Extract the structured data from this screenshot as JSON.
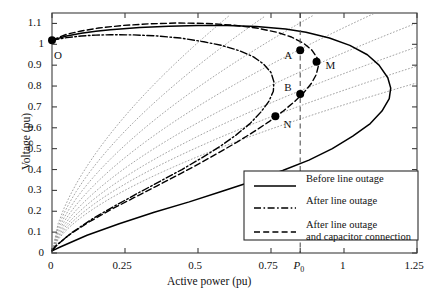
{
  "chart_data": {
    "type": "line",
    "title": "",
    "xlabel": "Active power (pu)",
    "ylabel": "Voltage (pu)",
    "xlim": [
      0,
      1.25
    ],
    "ylim": [
      0,
      1.15
    ],
    "grid": false,
    "xticks": [
      {
        "value": 0,
        "label": "0"
      },
      {
        "value": 0.25,
        "label": "0.25"
      },
      {
        "value": 0.5,
        "label": "0.5"
      },
      {
        "value": 0.75,
        "label": "0.75"
      },
      {
        "value": 0.85,
        "label": "P0"
      },
      {
        "value": 1,
        "label": "1"
      },
      {
        "value": 1.25,
        "label": "1.25"
      }
    ],
    "yticks": [
      {
        "value": 0,
        "label": "0"
      },
      {
        "value": 0.1,
        "label": "0.1"
      },
      {
        "value": 0.2,
        "label": "0.2"
      },
      {
        "value": 0.3,
        "label": "0.3"
      },
      {
        "value": 0.4,
        "label": "0.4"
      },
      {
        "value": 0.5,
        "label": "0.5"
      },
      {
        "value": 0.6,
        "label": "0.6"
      },
      {
        "value": 0.7,
        "label": "0.7"
      },
      {
        "value": 0.8,
        "label": "0.8"
      },
      {
        "value": 0.9,
        "label": "0.9"
      },
      {
        "value": 1.0,
        "label": "1"
      },
      {
        "value": 1.1,
        "label": "1.1"
      }
    ],
    "series": [
      {
        "name": "Before line outage",
        "style": "solid",
        "points": [
          [
            0.0,
            1.02
          ],
          [
            0.05,
            1.04
          ],
          [
            0.1,
            1.053
          ],
          [
            0.15,
            1.062
          ],
          [
            0.2,
            1.07
          ],
          [
            0.3,
            1.08
          ],
          [
            0.4,
            1.087
          ],
          [
            0.5,
            1.09
          ],
          [
            0.6,
            1.09
          ],
          [
            0.7,
            1.085
          ],
          [
            0.8,
            1.073
          ],
          [
            0.87,
            1.058
          ],
          [
            0.95,
            1.03
          ],
          [
            1.02,
            0.995
          ],
          [
            1.08,
            0.95
          ],
          [
            1.12,
            0.9
          ],
          [
            1.15,
            0.84
          ],
          [
            1.16,
            0.79
          ],
          [
            1.155,
            0.74
          ],
          [
            1.13,
            0.68
          ],
          [
            1.09,
            0.62
          ],
          [
            1.03,
            0.56
          ],
          [
            0.96,
            0.5
          ],
          [
            0.88,
            0.445
          ],
          [
            0.79,
            0.395
          ],
          [
            0.69,
            0.345
          ],
          [
            0.58,
            0.295
          ],
          [
            0.47,
            0.245
          ],
          [
            0.35,
            0.195
          ],
          [
            0.23,
            0.14
          ],
          [
            0.12,
            0.085
          ],
          [
            0.03,
            0.03
          ],
          [
            0.0,
            0.01
          ]
        ]
      },
      {
        "name": "After line outage",
        "style": "dashdot",
        "points": [
          [
            0.0,
            1.02
          ],
          [
            0.05,
            1.032
          ],
          [
            0.1,
            1.04
          ],
          [
            0.15,
            1.044
          ],
          [
            0.2,
            1.046
          ],
          [
            0.28,
            1.045
          ],
          [
            0.36,
            1.04
          ],
          [
            0.44,
            1.03
          ],
          [
            0.52,
            1.012
          ],
          [
            0.58,
            0.995
          ],
          [
            0.64,
            0.97
          ],
          [
            0.69,
            0.94
          ],
          [
            0.725,
            0.905
          ],
          [
            0.75,
            0.865
          ],
          [
            0.76,
            0.82
          ],
          [
            0.758,
            0.775
          ],
          [
            0.742,
            0.725
          ],
          [
            0.715,
            0.675
          ],
          [
            0.678,
            0.62
          ],
          [
            0.63,
            0.565
          ],
          [
            0.575,
            0.51
          ],
          [
            0.512,
            0.455
          ],
          [
            0.445,
            0.4
          ],
          [
            0.372,
            0.345
          ],
          [
            0.296,
            0.288
          ],
          [
            0.218,
            0.228
          ],
          [
            0.14,
            0.165
          ],
          [
            0.068,
            0.098
          ],
          [
            0.018,
            0.04
          ],
          [
            0.0,
            0.012
          ]
        ]
      },
      {
        "name": "After line outage and capacitor connection",
        "style": "dashed",
        "points": [
          [
            0.0,
            1.02
          ],
          [
            0.05,
            1.048
          ],
          [
            0.1,
            1.064
          ],
          [
            0.16,
            1.078
          ],
          [
            0.24,
            1.09
          ],
          [
            0.33,
            1.098
          ],
          [
            0.43,
            1.102
          ],
          [
            0.53,
            1.1
          ],
          [
            0.62,
            1.092
          ],
          [
            0.7,
            1.078
          ],
          [
            0.77,
            1.058
          ],
          [
            0.82,
            1.035
          ],
          [
            0.862,
            1.005
          ],
          [
            0.89,
            0.972
          ],
          [
            0.908,
            0.935
          ],
          [
            0.912,
            0.895
          ],
          [
            0.905,
            0.855
          ],
          [
            0.888,
            0.812
          ],
          [
            0.862,
            0.768
          ],
          [
            0.828,
            0.722
          ],
          [
            0.788,
            0.676
          ],
          [
            0.742,
            0.628
          ],
          [
            0.69,
            0.58
          ],
          [
            0.632,
            0.53
          ],
          [
            0.57,
            0.48
          ],
          [
            0.504,
            0.428
          ],
          [
            0.434,
            0.376
          ],
          [
            0.36,
            0.322
          ],
          [
            0.282,
            0.266
          ],
          [
            0.202,
            0.208
          ],
          [
            0.126,
            0.148
          ],
          [
            0.058,
            0.086
          ],
          [
            0.012,
            0.032
          ],
          [
            0.0,
            0.012
          ]
        ]
      }
    ],
    "load_characteristics": {
      "style": "dotted",
      "description": "Load characteristic lines radiating from origin",
      "slopes": [
        1.55,
        1.38,
        1.22,
        1.08,
        0.96,
        0.86,
        0.78,
        0.71
      ]
    },
    "vertical_line": {
      "value": 0.85,
      "style": "dashed",
      "label": "P0"
    },
    "annotations": [
      {
        "label": "O",
        "x": 0.0,
        "y": 1.02,
        "marker": true,
        "label_dx": 6,
        "label_dy": 16
      },
      {
        "label": "A",
        "x": 0.85,
        "y": 0.972,
        "marker": true,
        "label_dx": -12,
        "label_dy": 6
      },
      {
        "label": "M",
        "x": 0.906,
        "y": 0.917,
        "marker": true,
        "label_dx": 13,
        "label_dy": 4
      },
      {
        "label": "B",
        "x": 0.85,
        "y": 0.762,
        "marker": true,
        "label_dx": -12,
        "label_dy": -6
      },
      {
        "label": "N",
        "x": 0.765,
        "y": 0.655,
        "marker": true,
        "label_dx": 12,
        "label_dy": 9
      }
    ]
  },
  "legend": {
    "items": [
      {
        "label": "Before line outage",
        "style": "solid"
      },
      {
        "label": "After line outage",
        "style": "dashdot"
      },
      {
        "label": "After line outage",
        "label2": "and capacitor connection",
        "style": "dashed"
      }
    ]
  },
  "colors": {
    "curve": "#000000",
    "dotted": "#9a9a9a",
    "axis": "#3d3d3d",
    "background": "#ffffff"
  }
}
